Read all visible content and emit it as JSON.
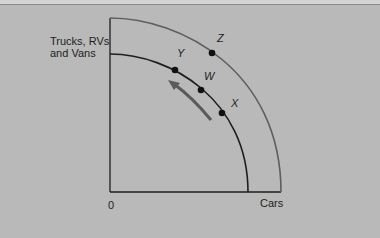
{
  "diagram": {
    "type": "production-possibilities-frontier",
    "y_axis_label": [
      "Trucks, RVs",
      "and Vans"
    ],
    "x_axis_label": "Cars",
    "origin_label": "0",
    "curves": [
      {
        "name": "outer-ppf",
        "points_on_curve": [
          "Z"
        ]
      },
      {
        "name": "inner-ppf",
        "points_on_curve": [
          "Y",
          "W",
          "X"
        ]
      }
    ],
    "points": {
      "Y": "Y",
      "W": "W",
      "X": "X",
      "Z": "Z"
    },
    "arrow": "movement along inner curve from X toward Y",
    "colors": {
      "background": "#b9b9b9",
      "outer_curve": "#5e5e5e",
      "inner_curve": "#1e1e1e",
      "arrow": "#5a5a5a"
    }
  }
}
